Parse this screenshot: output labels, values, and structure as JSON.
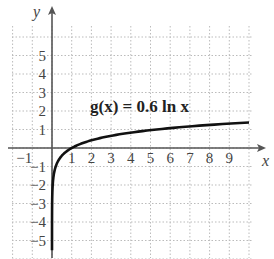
{
  "chart_data": {
    "type": "line",
    "title": "",
    "annotation": "g(x) = 0.6 ln x",
    "xlabel": "x",
    "ylabel": "y",
    "xlim": [
      -2,
      10.3
    ],
    "ylim": [
      -5.8,
      6.5
    ],
    "grid": true,
    "x_ticks": [
      -1,
      1,
      2,
      3,
      4,
      5,
      6,
      7,
      8,
      9
    ],
    "y_ticks": [
      5,
      4,
      3,
      2,
      1,
      -1,
      -2,
      -3,
      -4,
      -5
    ],
    "series": [
      {
        "name": "g(x) = 0.6 ln x",
        "function": "0.6*ln(x)",
        "x": [
          0.0001,
          0.001,
          0.01,
          0.05,
          0.1,
          0.2,
          0.5,
          1,
          2,
          3,
          4,
          5,
          6,
          7,
          8,
          9,
          10
        ],
        "y": [
          -5.53,
          -4.14,
          -2.76,
          -1.8,
          -1.38,
          -0.97,
          -0.42,
          0,
          0.42,
          0.66,
          0.83,
          0.97,
          1.08,
          1.17,
          1.25,
          1.32,
          1.38
        ]
      }
    ]
  },
  "labels": {
    "x_axis": "x",
    "y_axis": "y",
    "equation": "g(x) = 0.6 ln x",
    "x_ticks": [
      "−1",
      "1",
      "2",
      "3",
      "4",
      "5",
      "6",
      "7",
      "8",
      "9"
    ],
    "y_ticks_pos": [
      "5",
      "4",
      "3",
      "2",
      "1"
    ],
    "y_ticks_neg": [
      "−1",
      "−2",
      "−3",
      "−4",
      "−5"
    ]
  },
  "colors": {
    "axis": "#555555",
    "grid": "#bbbbbb",
    "curve": "#111111"
  }
}
